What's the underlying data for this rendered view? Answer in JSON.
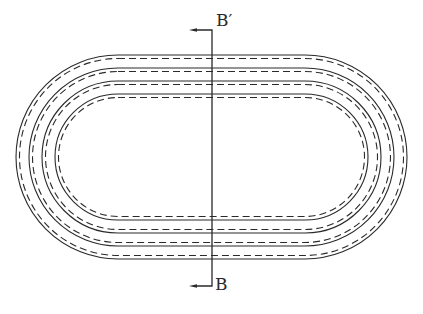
{
  "drawing": {
    "type": "concentric stadium rings with section cut",
    "stroke_color": "#2a2a2a",
    "background": "#ffffff",
    "center_y": 157,
    "left_arc_center_x": 118,
    "right_arc_center_x": 305,
    "rings": [
      {
        "solid_radius": 102,
        "dashed_radius": 98.5
      },
      {
        "solid_radius": 89,
        "dashed_radius": 85.5
      },
      {
        "solid_radius": 76,
        "dashed_radius": 72.5
      },
      {
        "solid_radius": 63,
        "dashed_radius": 59.5
      }
    ]
  },
  "section": {
    "line_x": 212,
    "top_y": 30,
    "bottom_y": 286,
    "arrow_tip_x": 189,
    "top_label": "B′",
    "bottom_label": "B"
  }
}
